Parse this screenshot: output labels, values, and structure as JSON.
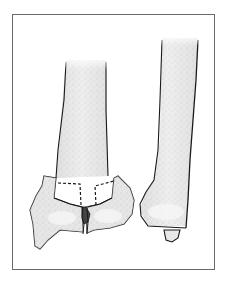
{
  "figure": {
    "colors": {
      "frame": "#6a6a6a",
      "outline": "#1a1a1a",
      "bone_fill": "#e6e6e6",
      "bone_highlight": "#f7f7f7",
      "stipple": "#8a8a8a",
      "background": "#ffffff"
    }
  }
}
